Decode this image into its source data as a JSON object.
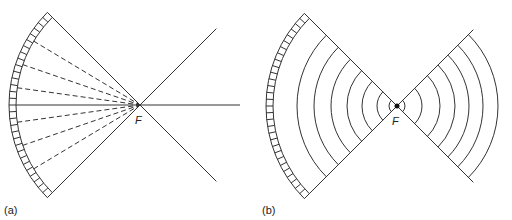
{
  "panels": [
    {
      "id": "a",
      "label": "(a)",
      "focus_label": "F",
      "focus": [
        140,
        105
      ],
      "description": "Concave mirror with dashed rays converging at focal point F, solid lines crossing beyond"
    },
    {
      "id": "b",
      "label": "(b)",
      "focus_label": "F",
      "focus": [
        397,
        106
      ],
      "description": "Concave mirror with circular wavefronts converging to F and diverging after"
    }
  ],
  "geometry": {
    "mirror_inner_radius": 124,
    "mirror_outer_radius": 131,
    "half_angle_deg": 45,
    "a_dashed_angles_deg": [
      -31,
      -19,
      -8,
      8,
      19,
      31
    ],
    "b_left_wavefront_radii": [
      8,
      20,
      35,
      50,
      66,
      83,
      100
    ],
    "b_right_wavefront_radii": [
      8,
      25,
      43,
      58,
      72,
      86,
      101
    ]
  },
  "colors": {
    "line": "#333333",
    "background": "#ffffff"
  }
}
